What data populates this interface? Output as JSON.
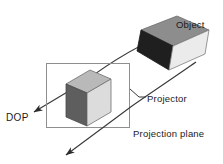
{
  "figure": {
    "labels": {
      "object": "Object",
      "dop": "DOP",
      "projector": "Projector",
      "projection_plane": "Projection plane"
    },
    "colors": {
      "line": "#3a3a3a",
      "plane_border": "#8a8a8a",
      "text": "#1a1a1a",
      "object_top": "#8d8d8d",
      "object_side": "#1c1c1c",
      "object_front": "#ebebeb",
      "cube_top": "#b9b9b9",
      "cube_left": "#5e5e5e",
      "cube_right": "#dcdcdc",
      "background": "#ffffff"
    },
    "geometry": {
      "projection_plane_rect": {
        "x": 46,
        "y": 63,
        "width": 84,
        "height": 65
      },
      "projector_upper_from": [
        168,
        34
      ],
      "projector_upper_to": [
        30,
        114
      ],
      "projector_lower_from": [
        196,
        63
      ],
      "projector_lower_to": [
        62,
        158
      ]
    }
  }
}
